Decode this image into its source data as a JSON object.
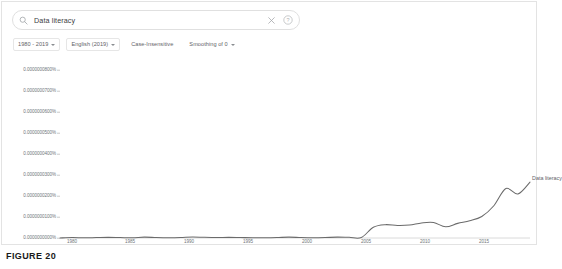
{
  "search": {
    "query": "Data literacy",
    "placeholder": "Search Google Books Ngram Viewer",
    "search_icon": "search-icon",
    "clear_icon": "close-icon",
    "help_icon": "help-circle-icon"
  },
  "options": {
    "year_range": "1980 - 2019",
    "corpus": "English (2019)",
    "case": "Case-Insensitive",
    "smoothing": "Smoothing of 0"
  },
  "caption": {
    "text": "FIGURE 20"
  },
  "colors": {
    "line": "#6b6b6b",
    "axis": "#d0d0d0",
    "text": "#70757a",
    "card_border": "#e3e3e3"
  },
  "chart_data": {
    "type": "line",
    "title": "",
    "xlabel": "",
    "ylabel": "",
    "xlim": [
      1980,
      2019
    ],
    "ylim": [
      0,
      8e-08
    ],
    "grid": false,
    "legend_position": "right-end-of-line",
    "series": [
      {
        "name": "Data literacy",
        "x": [
          1980,
          1981,
          1982,
          1983,
          1984,
          1985,
          1986,
          1987,
          1988,
          1989,
          1990,
          1991,
          1992,
          1993,
          1994,
          1995,
          1996,
          1997,
          1998,
          1999,
          2000,
          2001,
          2002,
          2003,
          2004,
          2005,
          2006,
          2007,
          2008,
          2009,
          2010,
          2011,
          2012,
          2013,
          2014,
          2015,
          2016,
          2017,
          2018,
          2019
        ],
        "values": [
          0.0,
          2e-10,
          1e-10,
          2e-10,
          3e-10,
          2e-10,
          1e-10,
          4e-10,
          2e-10,
          1e-10,
          2e-10,
          5e-10,
          3e-10,
          2e-10,
          3e-10,
          2e-10,
          1e-10,
          1e-10,
          2e-10,
          4e-10,
          2e-10,
          1e-10,
          2e-10,
          4e-10,
          3e-10,
          2e-10,
          5e-09,
          6.2e-09,
          5.8e-09,
          6e-09,
          7e-09,
          7.2e-09,
          5.2e-09,
          6.8e-09,
          8e-09,
          1e-08,
          1.5e-08,
          2.3e-08,
          2.05e-08,
          2.6e-08
        ]
      }
    ],
    "y_ticks": [
      "0.0000000800%",
      "0.0000000700%",
      "0.0000000600%",
      "0.0000000500%",
      "0.0000000400%",
      "0.0000000300%",
      "0.0000000200%",
      "0.0000000100%",
      "0.0000000000%"
    ],
    "x_ticks": [
      "1980",
      "1985",
      "1990",
      "1995",
      "2000",
      "2005",
      "2010",
      "2015"
    ]
  }
}
